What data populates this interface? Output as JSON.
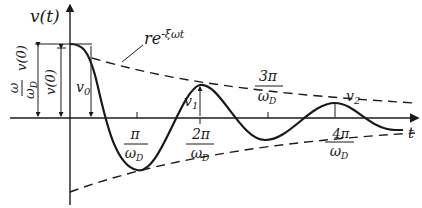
{
  "diagram": {
    "type": "damped free vibration response",
    "axes": {
      "y_label": "v(t)",
      "x_label": "t"
    },
    "envelope_label": "re",
    "envelope_exponent": "-ξωt",
    "left_labels": {
      "outer_num": "ω",
      "outer_den": "ω",
      "outer_den_sub": "D",
      "outer_suffix": "v(0)",
      "inner": "v(0)"
    },
    "amplitude_labels": {
      "v0": "v",
      "v0_sub": "0",
      "v1": "v",
      "v1_sub": "1",
      "v2": "v",
      "v2_sub": "2"
    },
    "tick_labels": [
      {
        "num": "π",
        "den": "ω",
        "sub": "D"
      },
      {
        "num": "2π",
        "den": "ω",
        "sub": "D"
      },
      {
        "num": "3π",
        "den": "ω",
        "sub": "D"
      },
      {
        "num": "4π",
        "den": "ω",
        "sub": "D"
      }
    ],
    "colors": {
      "ink": "#1a1a1a",
      "background": "#ffffff"
    }
  }
}
